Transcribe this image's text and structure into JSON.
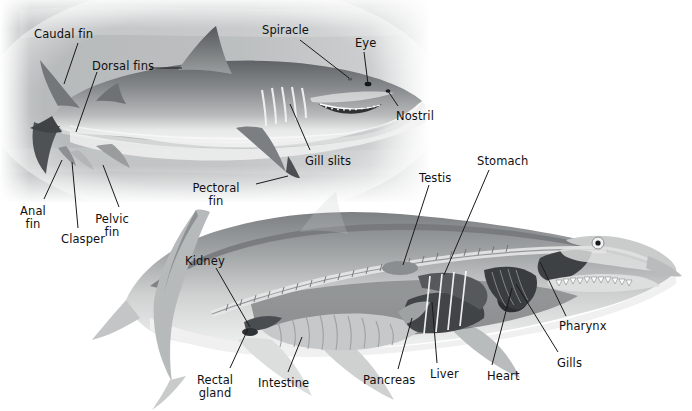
{
  "figure": {
    "kind": "anatomical-illustration",
    "panels": [
      {
        "name": "external-anatomy-panel",
        "background": "#b9bcbd"
      },
      {
        "name": "internal-anatomy-panel",
        "background": "#ffffff"
      }
    ],
    "colors": {
      "label_text": "#111111",
      "leader_line": "#1a1a1a",
      "panel_gray": "#b9bcbd",
      "body_light": "#d9dada",
      "body_mid": "#9a9c9d",
      "body_dark": "#5d6061",
      "page": "#ffffff"
    }
  },
  "labels": {
    "external": [
      {
        "id": "caudal-fin",
        "text": "Caudal fin",
        "x": 34,
        "y": 28,
        "align": "left"
      },
      {
        "id": "dorsal-fins",
        "text": "Dorsal fins",
        "x": 92,
        "y": 60,
        "align": "left"
      },
      {
        "id": "spiracle",
        "text": "Spiracle",
        "x": 262,
        "y": 24,
        "align": "left"
      },
      {
        "id": "eye",
        "text": "Eye",
        "x": 355,
        "y": 37,
        "align": "left"
      },
      {
        "id": "nostril",
        "text": "Nostril",
        "x": 396,
        "y": 110,
        "align": "left"
      },
      {
        "id": "gill-slits",
        "text": "Gill slits",
        "x": 305,
        "y": 155,
        "align": "left"
      },
      {
        "id": "pectoral-fin",
        "text": "Pectoral\nfin",
        "x": 216,
        "y": 182,
        "align": "center"
      },
      {
        "id": "anal-fin",
        "text": "Anal\nfin",
        "x": 33,
        "y": 205,
        "align": "center"
      },
      {
        "id": "clasper",
        "text": "Clasper",
        "x": 61,
        "y": 233,
        "align": "left"
      },
      {
        "id": "pelvic-fin",
        "text": "Pelvic\nfin",
        "x": 112,
        "y": 213,
        "align": "center"
      }
    ],
    "internal": [
      {
        "id": "testis",
        "text": "Testis",
        "x": 419,
        "y": 172,
        "align": "left"
      },
      {
        "id": "stomach",
        "text": "Stomach",
        "x": 477,
        "y": 155,
        "align": "left"
      },
      {
        "id": "kidney",
        "text": "Kidney",
        "x": 185,
        "y": 255,
        "align": "left"
      },
      {
        "id": "pharynx",
        "text": "Pharynx",
        "x": 559,
        "y": 320,
        "align": "left"
      },
      {
        "id": "gills",
        "text": "Gills",
        "x": 557,
        "y": 357,
        "align": "left"
      },
      {
        "id": "heart",
        "text": "Heart",
        "x": 487,
        "y": 370,
        "align": "left"
      },
      {
        "id": "liver",
        "text": "Liver",
        "x": 430,
        "y": 368,
        "align": "left"
      },
      {
        "id": "pancreas",
        "text": "Pancreas",
        "x": 363,
        "y": 374,
        "align": "left"
      },
      {
        "id": "intestine",
        "text": "Intestine",
        "x": 258,
        "y": 377,
        "align": "left"
      },
      {
        "id": "rectal-gland",
        "text": "Rectal\ngland",
        "x": 215,
        "y": 374,
        "align": "center"
      }
    ]
  },
  "leaders": {
    "external": [
      {
        "id": "leader-caudal-fin",
        "x1": 78,
        "y1": 43,
        "x2": 64,
        "y2": 84
      },
      {
        "id": "leader-dorsal-fins",
        "x1": 150,
        "y1": 68,
        "x2": 182,
        "y2": 68
      },
      {
        "id": "leader-dorsal-fins-2",
        "x1": 97,
        "y1": 72,
        "x2": 76,
        "y2": 132
      },
      {
        "id": "leader-spiracle",
        "x1": 300,
        "y1": 40,
        "x2": 349,
        "y2": 78
      },
      {
        "id": "leader-eye",
        "x1": 364,
        "y1": 52,
        "x2": 368,
        "y2": 84
      },
      {
        "id": "leader-nostril",
        "x1": 398,
        "y1": 106,
        "x2": 388,
        "y2": 91
      },
      {
        "id": "leader-gill-slits",
        "x1": 310,
        "y1": 150,
        "x2": 290,
        "y2": 104
      },
      {
        "id": "leader-pectoral-fin",
        "x1": 256,
        "y1": 184,
        "x2": 288,
        "y2": 176
      },
      {
        "id": "leader-anal-fin",
        "x1": 44,
        "y1": 199,
        "x2": 62,
        "y2": 160
      },
      {
        "id": "leader-clasper",
        "x1": 78,
        "y1": 228,
        "x2": 72,
        "y2": 162
      },
      {
        "id": "leader-pelvic-fin",
        "x1": 119,
        "y1": 207,
        "x2": 103,
        "y2": 165
      }
    ],
    "internal": [
      {
        "id": "leader-testis",
        "x1": 429,
        "y1": 185,
        "x2": 403,
        "y2": 265
      },
      {
        "id": "leader-stomach",
        "x1": 489,
        "y1": 170,
        "x2": 444,
        "y2": 275
      },
      {
        "id": "leader-kidney",
        "x1": 216,
        "y1": 268,
        "x2": 250,
        "y2": 327
      },
      {
        "id": "leader-pharynx",
        "x1": 566,
        "y1": 316,
        "x2": 540,
        "y2": 262
      },
      {
        "id": "leader-gills",
        "x1": 558,
        "y1": 352,
        "x2": 516,
        "y2": 284
      },
      {
        "id": "leader-heart",
        "x1": 492,
        "y1": 365,
        "x2": 512,
        "y2": 288
      },
      {
        "id": "leader-liver",
        "x1": 437,
        "y1": 363,
        "x2": 432,
        "y2": 302
      },
      {
        "id": "leader-pancreas",
        "x1": 398,
        "y1": 369,
        "x2": 412,
        "y2": 318
      },
      {
        "id": "leader-intestine",
        "x1": 288,
        "y1": 372,
        "x2": 302,
        "y2": 337
      },
      {
        "id": "leader-rectal-gland",
        "x1": 230,
        "y1": 368,
        "x2": 248,
        "y2": 329
      }
    ]
  }
}
